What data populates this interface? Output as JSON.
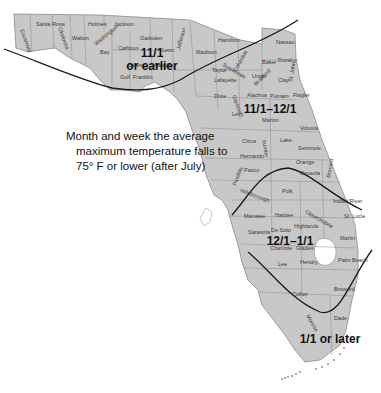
{
  "title_fragment": "g              g",
  "legend": {
    "line1": "Month and week the average",
    "line2": "maximum temperature falls to",
    "line3": "75° F or lower (after July)"
  },
  "zones": [
    {
      "id": "zone-1",
      "label_line1": "11/1",
      "label_line2": "or earlier"
    },
    {
      "id": "zone-2",
      "label": "11/1–12/1"
    },
    {
      "id": "zone-3",
      "label": "12/1–1/1"
    },
    {
      "id": "zone-4",
      "label": "1/1 or later"
    }
  ],
  "counties": [
    {
      "name": "Escambia"
    },
    {
      "name": "Santa Rosa"
    },
    {
      "name": "Okaloosa"
    },
    {
      "name": "Walton"
    },
    {
      "name": "Holmes"
    },
    {
      "name": "Jackson"
    },
    {
      "name": "Washington"
    },
    {
      "name": "Bay"
    },
    {
      "name": "Calhoun"
    },
    {
      "name": "Gadsden"
    },
    {
      "name": "Liberty"
    },
    {
      "name": "Leon"
    },
    {
      "name": "Wakulla"
    },
    {
      "name": "Gulf"
    },
    {
      "name": "Franklin"
    },
    {
      "name": "Jefferson"
    },
    {
      "name": "Madison"
    },
    {
      "name": "Hamilton"
    },
    {
      "name": "Taylor"
    },
    {
      "name": "Suwannee"
    },
    {
      "name": "Columbia"
    },
    {
      "name": "Lafayette"
    },
    {
      "name": "Baker"
    },
    {
      "name": "Nassau"
    },
    {
      "name": "Duval"
    },
    {
      "name": "Union"
    },
    {
      "name": "Bradford"
    },
    {
      "name": "Clay"
    },
    {
      "name": "St. Johns"
    },
    {
      "name": "Dixie"
    },
    {
      "name": "Gilchrist"
    },
    {
      "name": "Alachua"
    },
    {
      "name": "Putnam"
    },
    {
      "name": "Flagler"
    },
    {
      "name": "Levy"
    },
    {
      "name": "Marion"
    },
    {
      "name": "Volusia"
    },
    {
      "name": "Citrus"
    },
    {
      "name": "Sumter"
    },
    {
      "name": "Lake"
    },
    {
      "name": "Seminole"
    },
    {
      "name": "Hernando"
    },
    {
      "name": "Orange"
    },
    {
      "name": "Brevard"
    },
    {
      "name": "Pasco"
    },
    {
      "name": "Pinellas"
    },
    {
      "name": "Hillsborough"
    },
    {
      "name": "Polk"
    },
    {
      "name": "Osceola"
    },
    {
      "name": "Indian River"
    },
    {
      "name": "Manatee"
    },
    {
      "name": "Hardee"
    },
    {
      "name": "Okeechobee"
    },
    {
      "name": "St. Lucie"
    },
    {
      "name": "Highlands"
    },
    {
      "name": "Sarasota"
    },
    {
      "name": "De Soto"
    },
    {
      "name": "Martin"
    },
    {
      "name": "Charlotte"
    },
    {
      "name": "Glades"
    },
    {
      "name": "Lee"
    },
    {
      "name": "Hendry"
    },
    {
      "name": "Palm Beach"
    },
    {
      "name": "Collier"
    },
    {
      "name": "Broward"
    },
    {
      "name": "Monroe"
    },
    {
      "name": "Dade"
    }
  ],
  "colors": {
    "land": "#c8c8c8",
    "border": "#8a8a8a",
    "zone_line": "#1a1a1a",
    "water": "#ffffff"
  }
}
